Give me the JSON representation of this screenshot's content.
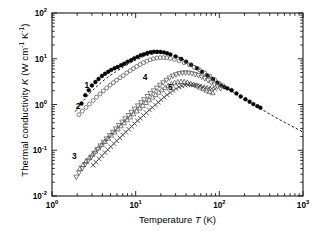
{
  "chart_data": {
    "type": "scatter",
    "title": "",
    "xlabel": "Temperature T (K)",
    "ylabel": "Thermal conductivity K (W cm⁻¹ K⁻¹)",
    "xlabel_parts": {
      "pre": "Temperature ",
      "italic": "T",
      "post": " (K)"
    },
    "ylabel_parts": {
      "pre": "Thermal conductivity ",
      "italic": "K",
      "post": " (W cm",
      "sup1": "-1",
      "mid": " K",
      "sup2": "-1",
      "end": ")"
    },
    "xscale": "log",
    "yscale": "log",
    "xlim": [
      1,
      1000
    ],
    "ylim": [
      0.01,
      100
    ],
    "grid": false,
    "legend": "inline-curve-numbers",
    "xticks": [
      {
        "value": 1,
        "label": "10",
        "exp": "0"
      },
      {
        "value": 10,
        "label": "10",
        "exp": "1"
      },
      {
        "value": 100,
        "label": "10",
        "exp": "2"
      },
      {
        "value": 1000,
        "label": "10",
        "exp": "3"
      }
    ],
    "yticks": [
      {
        "value": 100,
        "label": "10",
        "exp": "2"
      },
      {
        "value": 10,
        "label": "10",
        "exp": "1"
      },
      {
        "value": 1,
        "label": "10",
        "exp": "0"
      },
      {
        "value": 0.1,
        "label": "10",
        "exp": "-1"
      },
      {
        "value": 0.01,
        "label": "10",
        "exp": "-2"
      }
    ],
    "annotations": [
      {
        "text": "1",
        "x": 2.6,
        "y": 2.3
      },
      {
        "text": "2",
        "x": 2.05,
        "y": 0.78
      },
      {
        "text": "3",
        "x": 1.85,
        "y": 0.063
      },
      {
        "text": "4",
        "x": 13.0,
        "y": 3.4
      },
      {
        "text": "5",
        "x": 26.0,
        "y": 2.1
      }
    ],
    "series": [
      {
        "name": "1",
        "marker": "filled-circle",
        "color": "#000000",
        "points": [
          [
            2.25,
            1.05
          ],
          [
            2.5,
            1.6
          ],
          [
            2.75,
            2.05
          ],
          [
            3.0,
            2.6
          ],
          [
            3.3,
            3.1
          ],
          [
            3.6,
            3.6
          ],
          [
            3.95,
            4.2
          ],
          [
            4.3,
            4.7
          ],
          [
            4.7,
            5.2
          ],
          [
            5.1,
            5.7
          ],
          [
            5.6,
            6.2
          ],
          [
            6.1,
            6.6
          ],
          [
            6.7,
            7.2
          ],
          [
            7.3,
            7.8
          ],
          [
            8.0,
            8.6
          ],
          [
            8.8,
            9.3
          ],
          [
            9.6,
            10.2
          ],
          [
            10.5,
            11.0
          ],
          [
            11.5,
            11.9
          ],
          [
            12.6,
            12.6
          ],
          [
            13.8,
            13.4
          ],
          [
            15.1,
            13.9
          ],
          [
            16.5,
            14.2
          ],
          [
            18.1,
            14.2
          ],
          [
            19.8,
            14.1
          ],
          [
            21.7,
            13.8
          ],
          [
            23.7,
            13.2
          ],
          [
            26.0,
            12.4
          ],
          [
            30.0,
            11.2
          ],
          [
            35.0,
            9.9
          ],
          [
            40.0,
            8.6
          ],
          [
            46.0,
            7.4
          ],
          [
            54.0,
            6.2
          ],
          [
            62.0,
            5.2
          ],
          [
            72.0,
            4.3
          ],
          [
            84.0,
            3.6
          ],
          [
            95.0,
            3.0
          ],
          [
            105.0,
            2.6
          ],
          [
            115.0,
            2.4
          ],
          [
            125.0,
            2.25
          ],
          [
            140.0,
            2.05
          ],
          [
            160.0,
            1.75
          ],
          [
            180.0,
            1.5
          ],
          [
            205.0,
            1.3
          ],
          [
            230.0,
            1.15
          ],
          [
            255.0,
            1.02
          ],
          [
            285.0,
            0.92
          ],
          [
            310.0,
            0.85
          ]
        ]
      },
      {
        "name": "2",
        "marker": "open-circle",
        "color": "#555555",
        "points": [
          [
            2.1,
            0.6
          ],
          [
            2.3,
            0.72
          ],
          [
            2.55,
            0.86
          ],
          [
            2.8,
            1.02
          ],
          [
            3.1,
            1.22
          ],
          [
            3.4,
            1.45
          ],
          [
            3.75,
            1.7
          ],
          [
            4.1,
            1.98
          ],
          [
            4.5,
            2.3
          ],
          [
            4.95,
            2.65
          ],
          [
            5.4,
            3.0
          ],
          [
            5.9,
            3.4
          ],
          [
            6.5,
            3.85
          ],
          [
            7.1,
            4.3
          ],
          [
            7.8,
            4.9
          ],
          [
            8.6,
            5.5
          ],
          [
            9.4,
            6.1
          ],
          [
            10.3,
            6.8
          ],
          [
            11.3,
            7.5
          ],
          [
            12.4,
            8.2
          ],
          [
            13.6,
            8.9
          ],
          [
            14.9,
            9.5
          ],
          [
            16.3,
            10.0
          ],
          [
            17.9,
            10.4
          ],
          [
            19.6,
            10.6
          ],
          [
            21.5,
            10.6
          ],
          [
            23.5,
            10.5
          ],
          [
            26.0,
            10.2
          ],
          [
            29.0,
            9.7
          ],
          [
            33.0,
            9.0
          ],
          [
            38.0,
            8.2
          ],
          [
            44.0,
            7.3
          ],
          [
            50.0,
            6.5
          ],
          [
            58.0,
            5.7
          ],
          [
            67.0,
            4.9
          ],
          [
            77.0,
            4.2
          ],
          [
            88.0,
            3.5
          ],
          [
            100.0,
            2.9
          ],
          [
            112.0,
            2.55
          ]
        ]
      },
      {
        "name": "3",
        "marker": "down-triangle",
        "color": "#555555",
        "points": [
          [
            1.95,
            0.026
          ],
          [
            2.1,
            0.032
          ],
          [
            2.3,
            0.04
          ],
          [
            2.5,
            0.049
          ],
          [
            2.7,
            0.059
          ],
          [
            2.95,
            0.071
          ],
          [
            3.2,
            0.086
          ],
          [
            3.5,
            0.105
          ],
          [
            3.8,
            0.125
          ],
          [
            4.15,
            0.15
          ],
          [
            4.5,
            0.178
          ],
          [
            4.9,
            0.212
          ],
          [
            5.35,
            0.25
          ],
          [
            5.8,
            0.295
          ],
          [
            6.3,
            0.35
          ],
          [
            6.9,
            0.415
          ],
          [
            7.5,
            0.49
          ],
          [
            8.2,
            0.58
          ],
          [
            8.9,
            0.68
          ],
          [
            9.7,
            0.8
          ],
          [
            10.6,
            0.94
          ],
          [
            11.6,
            1.1
          ],
          [
            12.6,
            1.28
          ],
          [
            13.8,
            1.5
          ],
          [
            15.0,
            1.74
          ],
          [
            16.4,
            2.0
          ],
          [
            17.9,
            2.3
          ],
          [
            19.5,
            2.65
          ],
          [
            21.3,
            3.0
          ],
          [
            23.3,
            3.4
          ],
          [
            25.4,
            3.8
          ],
          [
            27.8,
            4.2
          ],
          [
            30.3,
            4.5
          ],
          [
            33.1,
            4.75
          ],
          [
            36.2,
            4.9
          ],
          [
            39.5,
            4.95
          ],
          [
            43.2,
            4.9
          ],
          [
            47.2,
            4.75
          ],
          [
            51.5,
            4.55
          ],
          [
            56.3,
            4.3
          ],
          [
            61.5,
            4.0
          ],
          [
            67.2,
            3.7
          ],
          [
            73.4,
            3.35
          ],
          [
            80.2,
            3.0
          ],
          [
            87.6,
            2.7
          ],
          [
            95.0,
            2.45
          ],
          [
            103.0,
            2.25
          ]
        ]
      },
      {
        "name": "4",
        "marker": "up-triangle",
        "color": "#555555",
        "points": [
          [
            2.15,
            0.04
          ],
          [
            2.35,
            0.048
          ],
          [
            2.55,
            0.057
          ],
          [
            2.8,
            0.068
          ],
          [
            3.05,
            0.081
          ],
          [
            3.3,
            0.095
          ],
          [
            3.6,
            0.112
          ],
          [
            3.95,
            0.132
          ],
          [
            4.3,
            0.155
          ],
          [
            4.7,
            0.182
          ],
          [
            5.1,
            0.212
          ],
          [
            5.6,
            0.248
          ],
          [
            6.1,
            0.29
          ],
          [
            6.65,
            0.34
          ],
          [
            7.25,
            0.395
          ],
          [
            7.9,
            0.46
          ],
          [
            8.6,
            0.53
          ],
          [
            9.4,
            0.62
          ],
          [
            10.3,
            0.72
          ],
          [
            11.2,
            0.83
          ],
          [
            12.2,
            0.95
          ],
          [
            13.3,
            1.1
          ],
          [
            14.5,
            1.26
          ],
          [
            15.9,
            1.44
          ],
          [
            17.3,
            1.63
          ],
          [
            18.9,
            1.85
          ],
          [
            20.6,
            2.08
          ],
          [
            22.5,
            2.33
          ],
          [
            24.5,
            2.58
          ],
          [
            26.8,
            2.8
          ],
          [
            29.2,
            2.98
          ],
          [
            31.9,
            3.1
          ],
          [
            34.8,
            3.15
          ],
          [
            38.0,
            3.12
          ],
          [
            41.4,
            3.02
          ],
          [
            45.2,
            2.88
          ],
          [
            49.3,
            2.72
          ],
          [
            53.8,
            2.55
          ],
          [
            58.7,
            2.38
          ],
          [
            64.1,
            2.2
          ],
          [
            70.0,
            2.05
          ],
          [
            76.3,
            1.92
          ],
          [
            83.3,
            1.8
          ]
        ]
      },
      {
        "name": "5",
        "marker": "cross-x",
        "color": "#333333",
        "points": [
          [
            3.1,
            0.047
          ],
          [
            3.35,
            0.055
          ],
          [
            3.65,
            0.065
          ],
          [
            3.95,
            0.076
          ],
          [
            4.3,
            0.089
          ],
          [
            4.65,
            0.103
          ],
          [
            5.05,
            0.12
          ],
          [
            5.5,
            0.14
          ],
          [
            5.95,
            0.162
          ],
          [
            6.45,
            0.187
          ],
          [
            7.0,
            0.216
          ],
          [
            7.6,
            0.25
          ],
          [
            8.25,
            0.288
          ],
          [
            8.95,
            0.332
          ],
          [
            9.7,
            0.382
          ],
          [
            10.5,
            0.44
          ],
          [
            11.4,
            0.5
          ],
          [
            12.4,
            0.58
          ],
          [
            13.4,
            0.66
          ],
          [
            14.6,
            0.76
          ],
          [
            15.8,
            0.86
          ],
          [
            17.2,
            0.98
          ],
          [
            18.6,
            1.12
          ],
          [
            20.2,
            1.27
          ],
          [
            21.9,
            1.44
          ],
          [
            23.8,
            1.62
          ],
          [
            25.8,
            1.82
          ],
          [
            28.0,
            2.02
          ],
          [
            30.4,
            2.22
          ],
          [
            33.0,
            2.4
          ],
          [
            35.8,
            2.55
          ],
          [
            38.9,
            2.65
          ],
          [
            42.2,
            2.7
          ],
          [
            45.8,
            2.7
          ],
          [
            49.7,
            2.66
          ],
          [
            54.0,
            2.6
          ],
          [
            58.6,
            2.52
          ],
          [
            63.6,
            2.44
          ],
          [
            69.0,
            2.36
          ],
          [
            75.0,
            2.28
          ],
          [
            81.4,
            2.22
          ],
          [
            88.4,
            2.18
          ]
        ]
      }
    ],
    "dashed_line": {
      "name": "extrapolation-dashed-curve",
      "style": "dashed",
      "color": "#000000",
      "points": [
        [
          1.9,
          0.7
        ],
        [
          2.3,
          1.15
        ],
        [
          2.9,
          1.85
        ],
        [
          3.6,
          2.7
        ],
        [
          4.5,
          3.8
        ],
        [
          5.6,
          5.0
        ],
        [
          7.0,
          6.5
        ],
        [
          8.7,
          8.2
        ],
        [
          10.5,
          9.8
        ],
        [
          12.5,
          11.2
        ],
        [
          15.0,
          12.4
        ],
        [
          18.0,
          13.1
        ],
        [
          21.5,
          13.2
        ],
        [
          25.0,
          12.7
        ],
        [
          30.0,
          11.5
        ],
        [
          36.0,
          10.0
        ],
        [
          43.0,
          8.4
        ],
        [
          52.0,
          6.8
        ],
        [
          62.0,
          5.4
        ],
        [
          75.0,
          4.2
        ],
        [
          90.0,
          3.3
        ],
        [
          110.0,
          2.6
        ],
        [
          135.0,
          2.05
        ],
        [
          165.0,
          1.62
        ],
        [
          200.0,
          1.3
        ],
        [
          250.0,
          1.02
        ],
        [
          320.0,
          0.78
        ],
        [
          400.0,
          0.62
        ],
        [
          520.0,
          0.47
        ],
        [
          650.0,
          0.38
        ],
        [
          800.0,
          0.31
        ],
        [
          1000.0,
          0.25
        ]
      ]
    }
  }
}
